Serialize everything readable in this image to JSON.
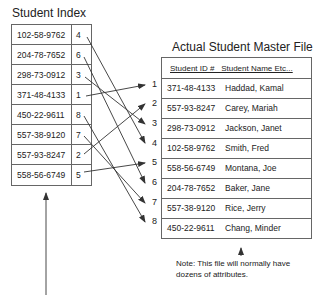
{
  "index": {
    "title": "Student Index",
    "rows": [
      {
        "key": "102-58-9762",
        "pointer": "4"
      },
      {
        "key": "204-78-7652",
        "pointer": "6"
      },
      {
        "key": "298-73-0912",
        "pointer": "3"
      },
      {
        "key": "371-48-4133",
        "pointer": "1"
      },
      {
        "key": "450-22-9611",
        "pointer": "8"
      },
      {
        "key": "557-38-9120",
        "pointer": "7"
      },
      {
        "key": "557-93-8247",
        "pointer": "2"
      },
      {
        "key": "558-56-6749",
        "pointer": "5"
      }
    ]
  },
  "master": {
    "title": "Actual Student Master File",
    "header": "Student ID #   Student Name Etc...",
    "rows": [
      {
        "num": "1",
        "id": "371-48-4133",
        "name": "Haddad, Kamal"
      },
      {
        "num": "2",
        "id": "557-93-8247",
        "name": "Carey, Mariah"
      },
      {
        "num": "3",
        "id": "298-73-0912",
        "name": "Jackson, Janet"
      },
      {
        "num": "4",
        "id": "102-58-9762",
        "name": "Smith, Fred"
      },
      {
        "num": "5",
        "id": "558-56-6749",
        "name": "Montana, Joe"
      },
      {
        "num": "6",
        "id": "204-78-7652",
        "name": "Baker, Jane"
      },
      {
        "num": "7",
        "id": "557-38-9120",
        "name": "Rice, Jerry"
      },
      {
        "num": "8",
        "id": "450-22-9611",
        "name": "Chang, Minder"
      }
    ],
    "note": "Note: This file will normally have dozens of attributes."
  },
  "colors": {
    "line": "#333333",
    "border": "#666666",
    "text": "#222222"
  }
}
